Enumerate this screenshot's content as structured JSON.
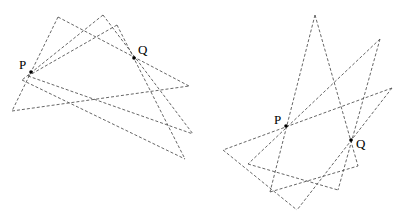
{
  "figures": [
    {
      "name": "left-figure",
      "points": [
        {
          "label": "P"
        },
        {
          "label": "Q"
        }
      ]
    },
    {
      "name": "right-figure",
      "points": [
        {
          "label": "P"
        },
        {
          "label": "Q"
        }
      ]
    }
  ],
  "style": {
    "line_color": "#555555",
    "point_color": "#000000",
    "background": "#ffffff"
  }
}
